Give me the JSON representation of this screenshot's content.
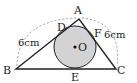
{
  "diagram": {
    "type": "geometry",
    "points": {
      "A": {
        "label": "A",
        "x": 79,
        "y": 19
      },
      "B": {
        "label": "B",
        "x": 16,
        "y": 69
      },
      "C": {
        "label": "C",
        "x": 116,
        "y": 69
      },
      "D": {
        "label": "D",
        "x": 63,
        "y": 29
      },
      "E": {
        "label": "E",
        "x": 75,
        "y": 69
      },
      "F": {
        "label": "F",
        "x": 94,
        "y": 31
      },
      "O": {
        "label": "O",
        "x": 75,
        "y": 47
      }
    },
    "circle": {
      "cx": 75,
      "cy": 47,
      "r": 21,
      "fill": "#d3d3d3",
      "stroke": "#222222"
    },
    "measurements": {
      "left": "6cm",
      "right": "6cm"
    },
    "colors": {
      "line": "#222222",
      "dashed": "#888888",
      "circle_fill": "#d3d3d3"
    }
  }
}
